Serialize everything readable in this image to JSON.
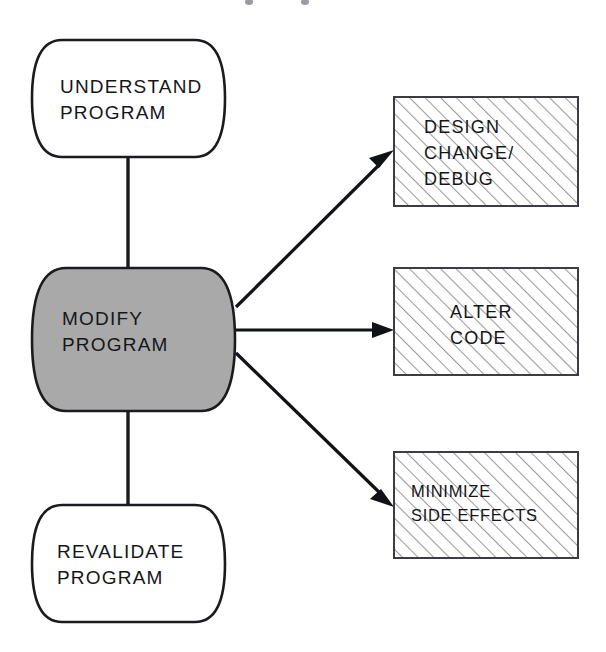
{
  "diagram": {
    "type": "flow-diagram",
    "canvas": {
      "width": 606,
      "height": 652,
      "background": "#ffffff"
    },
    "colors": {
      "stroke": "#1a1b1f",
      "highlight_fill": "#a9a9a9",
      "hatch_stroke": "#9a9aa0",
      "box_stroke": "#3c3d42",
      "text": "#15161a",
      "page_background": "#ffffff"
    },
    "process_nodes": [
      {
        "id": "understand-program",
        "shape": "drum",
        "fill": "white",
        "lines": [
          "UNDERSTAND",
          "PROGRAM"
        ],
        "x": 32,
        "y": 40,
        "width": 193,
        "height": 117
      },
      {
        "id": "modify-program",
        "shape": "drum",
        "fill": "gray",
        "lines": [
          "MODIFY",
          "PROGRAM"
        ],
        "x": 32,
        "y": 268,
        "width": 203,
        "height": 143
      },
      {
        "id": "revalidate-program",
        "shape": "drum",
        "fill": "white",
        "lines": [
          "REVALIDATE",
          "PROGRAM"
        ],
        "x": 32,
        "y": 505,
        "width": 193,
        "height": 117
      }
    ],
    "activity_boxes": [
      {
        "id": "design-change-debug",
        "shape": "hatched-rectangle",
        "lines": [
          "DESIGN",
          "CHANGE/",
          "DEBUG"
        ],
        "x": 394,
        "y": 97,
        "width": 184,
        "height": 109
      },
      {
        "id": "alter-code",
        "shape": "hatched-rectangle",
        "lines": [
          "ALTER",
          "CODE"
        ],
        "x": 394,
        "y": 268,
        "width": 184,
        "height": 107
      },
      {
        "id": "minimize-side-effects",
        "shape": "hatched-rectangle",
        "lines": [
          "MINIMIZE",
          "SIDE EFFECTS"
        ],
        "x": 394,
        "y": 452,
        "width": 184,
        "height": 106
      }
    ],
    "connectors": [
      {
        "id": "understand-to-modify",
        "kind": "line",
        "from": "understand-program",
        "to": "modify-program"
      },
      {
        "id": "modify-to-revalidate",
        "kind": "line",
        "from": "modify-program",
        "to": "revalidate-program"
      },
      {
        "id": "modify-to-design-change",
        "kind": "arrow",
        "from": "modify-program",
        "to": "design-change-debug"
      },
      {
        "id": "modify-to-alter-code",
        "kind": "arrow",
        "from": "modify-program",
        "to": "alter-code"
      },
      {
        "id": "modify-to-minimize-side-effects",
        "kind": "arrow",
        "from": "modify-program",
        "to": "minimize-side-effects"
      }
    ]
  }
}
